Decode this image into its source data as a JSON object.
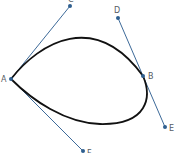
{
  "diagram": {
    "title": "",
    "colors": {
      "curve": "#111111",
      "tangent": "#3d6a99",
      "point": "#2f5f8f",
      "label": "#555b63",
      "background": "#ffffff"
    },
    "points": [
      {
        "id": "A",
        "label": "A",
        "x": 11,
        "y": 79
      },
      {
        "id": "B",
        "label": "B",
        "x": 143,
        "y": 76
      },
      {
        "id": "C",
        "label": "C",
        "x": 70,
        "y": 6
      },
      {
        "id": "D",
        "label": "D",
        "x": 118,
        "y": 18
      },
      {
        "id": "E",
        "label": "E",
        "x": 165,
        "y": 127
      },
      {
        "id": "F",
        "label": "F",
        "x": 83,
        "y": 151
      }
    ],
    "tangent_lines": [
      {
        "from": "A",
        "to": "C"
      },
      {
        "from": "A",
        "to": "F"
      },
      {
        "from": "D",
        "to": "E"
      }
    ],
    "curve": {
      "type": "closed-bezier",
      "passes_through": [
        "A",
        "B"
      ]
    }
  }
}
